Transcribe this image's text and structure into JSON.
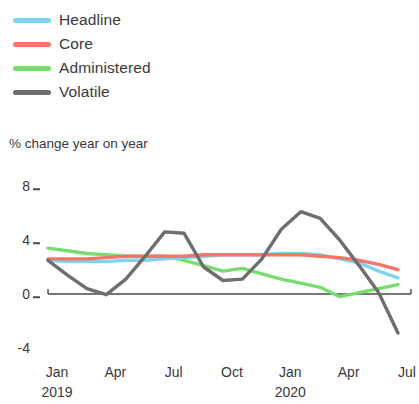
{
  "chart_data": {
    "type": "line",
    "title": "",
    "subtitle": "",
    "ylabel": "% change year on year",
    "xlabel": "",
    "ylim": [
      -4,
      8
    ],
    "yticks": [
      8,
      4,
      0,
      -4
    ],
    "ytick_labels": [
      "8",
      "4",
      "0",
      "-4"
    ],
    "grid": false,
    "zero_line": true,
    "legend_position": "top-left",
    "x": [
      "Jan 2019",
      "Feb 2019",
      "Mar 2019",
      "Apr 2019",
      "May 2019",
      "Jun 2019",
      "Jul 2019",
      "Aug 2019",
      "Sep 2019",
      "Oct 2019",
      "Nov 2019",
      "Dec 2019",
      "Jan 2020",
      "Feb 2020",
      "Mar 2020",
      "Apr 2020",
      "May 2020",
      "Jun 2020",
      "Jul 2020"
    ],
    "xtick_labels": [
      "Jan",
      "Apr",
      "Jul",
      "Oct",
      "Jan",
      "Apr",
      "Jul"
    ],
    "xtick_years": [
      "2019",
      "",
      "",
      "",
      "2020",
      "",
      ""
    ],
    "series": [
      {
        "name": "Headline",
        "color": "#7fd4ee",
        "values": [
          2.5,
          2.4,
          2.4,
          2.4,
          2.5,
          2.5,
          2.6,
          2.7,
          2.8,
          2.9,
          2.9,
          2.9,
          3.0,
          3.0,
          2.9,
          2.6,
          2.3,
          1.7,
          1.2
        ]
      },
      {
        "name": "Core",
        "color": "#f4756a",
        "values": [
          2.6,
          2.6,
          2.6,
          2.7,
          2.8,
          2.8,
          2.8,
          2.8,
          2.9,
          2.9,
          2.9,
          2.9,
          2.9,
          2.9,
          2.8,
          2.7,
          2.5,
          2.2,
          1.8
        ]
      },
      {
        "name": "Administered",
        "color": "#77dd6f",
        "values": [
          3.4,
          3.2,
          3.0,
          2.9,
          2.8,
          2.8,
          2.8,
          2.5,
          2.1,
          1.7,
          1.9,
          1.5,
          1.1,
          0.8,
          0.5,
          -0.2,
          0.1,
          0.4,
          0.7
        ]
      },
      {
        "name": "Volatile",
        "color": "#6e6e6e",
        "values": [
          2.5,
          1.4,
          0.4,
          -0.05,
          1.1,
          2.8,
          4.6,
          4.5,
          2.0,
          1.0,
          1.1,
          2.6,
          4.8,
          6.1,
          5.6,
          4.0,
          2.1,
          0.1,
          -2.9
        ]
      }
    ]
  },
  "legend": {
    "items": [
      {
        "label": "Headline",
        "color": "#7fd4ee"
      },
      {
        "label": "Core",
        "color": "#f4756a"
      },
      {
        "label": "Administered",
        "color": "#77dd6f"
      },
      {
        "label": "Volatile",
        "color": "#6e6e6e"
      }
    ]
  },
  "axis": {
    "title": "% change year on year"
  }
}
